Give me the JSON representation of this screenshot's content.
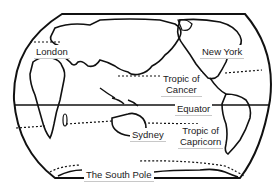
{
  "diagram": {
    "type": "world-map-outline",
    "style": {
      "line_color": "#111111",
      "background": "#ffffff",
      "label_bg": "#ffffff"
    },
    "labels": {
      "london": "London",
      "new_york": "New York",
      "tropic_of_cancer": {
        "line1": "Tropic of",
        "line2": "Cancer"
      },
      "equator": "Equator",
      "sydney": "Sydney",
      "tropic_of_capricorn": {
        "line1": "Tropic of",
        "line2": "Capricorn"
      },
      "south_pole": "The South Pole"
    },
    "lines": [
      {
        "name": "equator",
        "style": "solid"
      },
      {
        "name": "tropic-of-cancer",
        "style": "dashed"
      },
      {
        "name": "tropic-of-capricorn",
        "style": "dashed"
      },
      {
        "name": "antarctic-circle",
        "style": "dashed"
      }
    ]
  }
}
